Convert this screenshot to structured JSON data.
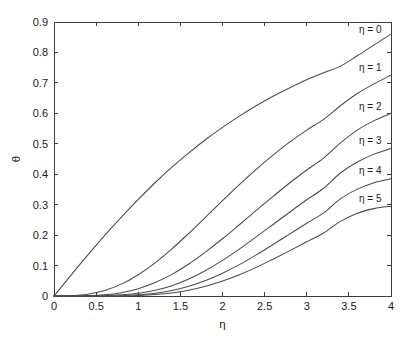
{
  "chart_data": {
    "type": "line",
    "title": "",
    "xlabel": "η",
    "ylabel": "θ",
    "xlim": [
      0,
      4
    ],
    "ylim": [
      0,
      0.9
    ],
    "grid": false,
    "legend_position": "inline-right-above-curve",
    "x_ticks": [
      "0",
      "0.5",
      "1",
      "1.5",
      "2",
      "2.5",
      "3",
      "3.5",
      "4"
    ],
    "x_tick_values": [
      0,
      0.5,
      1,
      1.5,
      2,
      2.5,
      3,
      3.5,
      4
    ],
    "y_ticks": [
      "0",
      "0.1",
      "0.2",
      "0.3",
      "0.4",
      "0.5",
      "0.6",
      "0.7",
      "0.8",
      "0.9"
    ],
    "y_tick_values": [
      0,
      0.1,
      0.2,
      0.3,
      0.4,
      0.5,
      0.6,
      0.7,
      0.8,
      0.9
    ],
    "x": [
      0,
      0.2,
      0.4,
      0.6,
      0.8,
      1.0,
      1.2,
      1.4,
      1.6,
      1.8,
      2.0,
      2.2,
      2.4,
      2.6,
      2.8,
      3.0,
      3.2,
      3.4,
      3.6,
      3.8,
      4.0
    ],
    "series": [
      {
        "name": "η = 0",
        "label": "η = 0",
        "label_x": 3.62,
        "label_y": 0.875,
        "values": [
          0,
          0.068,
          0.134,
          0.198,
          0.259,
          0.317,
          0.372,
          0.423,
          0.47,
          0.514,
          0.554,
          0.591,
          0.625,
          0.656,
          0.684,
          0.71,
          0.733,
          0.755,
          0.789,
          0.825,
          0.86
        ]
      },
      {
        "name": "η = 1",
        "label": "η = 1",
        "label_x": 3.62,
        "label_y": 0.748,
        "values": [
          0,
          0.001,
          0.006,
          0.018,
          0.039,
          0.07,
          0.109,
          0.155,
          0.206,
          0.259,
          0.313,
          0.366,
          0.416,
          0.463,
          0.506,
          0.545,
          0.58,
          0.625,
          0.665,
          0.697,
          0.725
        ]
      },
      {
        "name": "η = 2",
        "label": "η = 2",
        "label_x": 3.62,
        "label_y": 0.622,
        "values": [
          0,
          0.0,
          0.001,
          0.004,
          0.011,
          0.024,
          0.044,
          0.071,
          0.105,
          0.145,
          0.188,
          0.234,
          0.281,
          0.327,
          0.372,
          0.414,
          0.453,
          0.503,
          0.545,
          0.576,
          0.6
        ]
      },
      {
        "name": "η = 3",
        "label": "η = 3",
        "label_x": 3.62,
        "label_y": 0.508,
        "values": [
          0,
          0.0,
          0.0,
          0.001,
          0.004,
          0.009,
          0.019,
          0.034,
          0.056,
          0.084,
          0.117,
          0.154,
          0.194,
          0.235,
          0.276,
          0.316,
          0.354,
          0.404,
          0.44,
          0.466,
          0.485
        ]
      },
      {
        "name": "η = 4",
        "label": "η = 4",
        "label_x": 3.62,
        "label_y": 0.409,
        "values": [
          0,
          0.0,
          0.0,
          0.0,
          0.001,
          0.004,
          0.009,
          0.018,
          0.032,
          0.051,
          0.075,
          0.103,
          0.135,
          0.169,
          0.204,
          0.239,
          0.273,
          0.319,
          0.351,
          0.372,
          0.385
        ]
      },
      {
        "name": "η = 5",
        "label": "η = 5",
        "label_x": 3.62,
        "label_y": 0.318,
        "values": [
          0,
          0.0,
          0.0,
          0.0,
          0.0,
          0.002,
          0.005,
          0.01,
          0.019,
          0.032,
          0.049,
          0.07,
          0.094,
          0.121,
          0.149,
          0.178,
          0.207,
          0.245,
          0.272,
          0.287,
          0.295
        ]
      }
    ]
  },
  "colors": {
    "background": "#ffffff",
    "axis": "#3c3c3c",
    "curve": "#4a4a4a",
    "text": "#1a1a1a"
  }
}
